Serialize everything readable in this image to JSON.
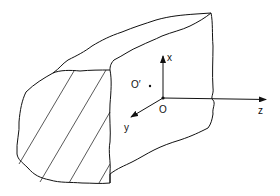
{
  "figure": {
    "labels": {
      "x_axis": "x",
      "y_axis": "y",
      "z_axis": "z",
      "origin": "O",
      "point": "O′"
    },
    "colors": {
      "stroke": "#111111",
      "background": "#ffffff"
    }
  }
}
